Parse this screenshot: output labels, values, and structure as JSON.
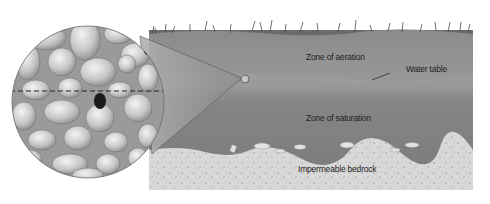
{
  "diagram": {
    "labels": {
      "zone_aeration": "Zone of aeration",
      "water_table": "Water table",
      "zone_saturation": "Zone of saturation",
      "bedrock": "Impermeable bedrock"
    },
    "colors": {
      "background": "#ffffff",
      "aeration_zone": "#8f8f8f",
      "saturation_zone": "#7c7c7c",
      "bedrock": "#d6d6d6",
      "grass": "#5a5a5a",
      "pebble": "#c8c8c8",
      "water_table_line": "#222222"
    }
  }
}
